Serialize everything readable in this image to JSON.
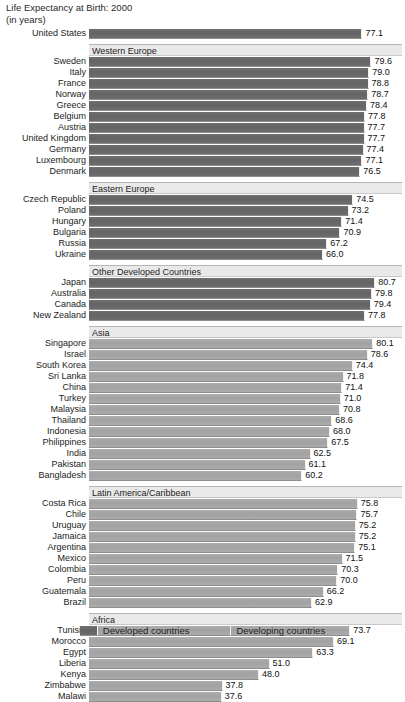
{
  "title": {
    "line1": "Life Expectancy at Birth: 2000",
    "line2": "(in years)"
  },
  "legend": {
    "developed_label": "Developed countries",
    "developing_label": "Developing countries"
  },
  "colors": {
    "developed": "#686868",
    "developing": "#a6a6a6",
    "band": "#e9e9e9",
    "background": "#ffffff",
    "text": "#1a1a1a"
  },
  "axis": {
    "origin_px": 90,
    "px_per_year": 3.56,
    "min": 0,
    "max": 88
  },
  "chart_data": {
    "type": "bar",
    "orientation": "horizontal",
    "title": "Life Expectancy at Birth: 2000",
    "subtitle": "(in years)",
    "xlabel": "",
    "ylabel": "",
    "unit": "years",
    "grid": false,
    "legend_position": "bottom",
    "series": [
      {
        "name": "Developed countries",
        "color": "#686868"
      },
      {
        "name": "Developing countries",
        "color": "#a6a6a6"
      }
    ],
    "groups": [
      {
        "header": null,
        "group_type": "developed",
        "items": [
          {
            "label": "United States",
            "value": 77.1
          }
        ]
      },
      {
        "header": "Western Europe",
        "group_type": "developed",
        "items": [
          {
            "label": "Sweden",
            "value": 79.6
          },
          {
            "label": "Italy",
            "value": 79.0
          },
          {
            "label": "France",
            "value": 78.8
          },
          {
            "label": "Norway",
            "value": 78.7
          },
          {
            "label": "Greece",
            "value": 78.4
          },
          {
            "label": "Belgium",
            "value": 77.8
          },
          {
            "label": "Austria",
            "value": 77.7
          },
          {
            "label": "United Kingdom",
            "value": 77.7
          },
          {
            "label": "Germany",
            "value": 77.4
          },
          {
            "label": "Luxembourg",
            "value": 77.1
          },
          {
            "label": "Denmark",
            "value": 76.5
          }
        ]
      },
      {
        "header": "Eastern Europe",
        "group_type": "developed",
        "items": [
          {
            "label": "Czech Republic",
            "value": 74.5
          },
          {
            "label": "Poland",
            "value": 73.2
          },
          {
            "label": "Hungary",
            "value": 71.4
          },
          {
            "label": "Bulgaria",
            "value": 70.9
          },
          {
            "label": "Russia",
            "value": 67.2
          },
          {
            "label": "Ukraine",
            "value": 66.0
          }
        ]
      },
      {
        "header": "Other Developed Countries",
        "group_type": "developed",
        "items": [
          {
            "label": "Japan",
            "value": 80.7
          },
          {
            "label": "Australia",
            "value": 79.8
          },
          {
            "label": "Canada",
            "value": 79.4
          },
          {
            "label": "New Zealand",
            "value": 77.8
          }
        ]
      },
      {
        "header": "Asia",
        "group_type": "developing",
        "items": [
          {
            "label": "Singapore",
            "value": 80.1
          },
          {
            "label": "Israel",
            "value": 78.6
          },
          {
            "label": "South Korea",
            "value": 74.4
          },
          {
            "label": "Sri Lanka",
            "value": 71.8
          },
          {
            "label": "China",
            "value": 71.4
          },
          {
            "label": "Turkey",
            "value": 71.0
          },
          {
            "label": "Malaysia",
            "value": 70.8
          },
          {
            "label": "Thailand",
            "value": 68.6
          },
          {
            "label": "Indonesia",
            "value": 68.0
          },
          {
            "label": "Philippines",
            "value": 67.5
          },
          {
            "label": "India",
            "value": 62.5
          },
          {
            "label": "Pakistan",
            "value": 61.1
          },
          {
            "label": "Bangladesh",
            "value": 60.2
          }
        ]
      },
      {
        "header": "Latin America/Caribbean",
        "group_type": "developing",
        "items": [
          {
            "label": "Costa Rica",
            "value": 75.8
          },
          {
            "label": "Chile",
            "value": 75.7
          },
          {
            "label": "Uruguay",
            "value": 75.2
          },
          {
            "label": "Jamaica",
            "value": 75.2
          },
          {
            "label": "Argentina",
            "value": 75.1
          },
          {
            "label": "Mexico",
            "value": 71.5
          },
          {
            "label": "Colombia",
            "value": 70.3
          },
          {
            "label": "Peru",
            "value": 70.0
          },
          {
            "label": "Guatemala",
            "value": 66.2
          },
          {
            "label": "Brazil",
            "value": 62.9
          }
        ]
      },
      {
        "header": "Africa",
        "group_type": "developing",
        "items": [
          {
            "label": "Tunisia",
            "value": 73.7
          },
          {
            "label": "Morocco",
            "value": 69.1
          },
          {
            "label": "Egypt",
            "value": 63.3
          },
          {
            "label": "Liberia",
            "value": 51.0
          },
          {
            "label": "Kenya",
            "value": 48.0
          },
          {
            "label": "Zimbabwe",
            "value": 37.8
          },
          {
            "label": "Malawi",
            "value": 37.6
          }
        ]
      }
    ]
  }
}
